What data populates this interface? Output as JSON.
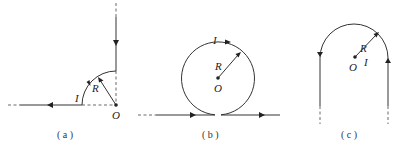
{
  "figures": [
    {
      "id": "a",
      "caption": "( a )",
      "labels": {
        "current": "I",
        "radius": "R",
        "center": "O"
      },
      "description": "Quarter-circle arc of radius R centered at O joining a vertical wire from above and a horizontal wire going left"
    },
    {
      "id": "b",
      "caption": "( b )",
      "labels": {
        "current": "I",
        "radius": "R",
        "center": "O"
      },
      "description": "Full circular loop of radius R centered at O, tangent to a straight horizontal wire carrying current to the right"
    },
    {
      "id": "c",
      "caption": "( c )",
      "labels": {
        "current": "I",
        "radius": "R",
        "center": "O"
      },
      "description": "Semicircular arc of radius R centered at O joining two long parallel vertical wires (hairpin)"
    }
  ],
  "colors": {
    "line": "#333333",
    "background": "#ffffff"
  }
}
